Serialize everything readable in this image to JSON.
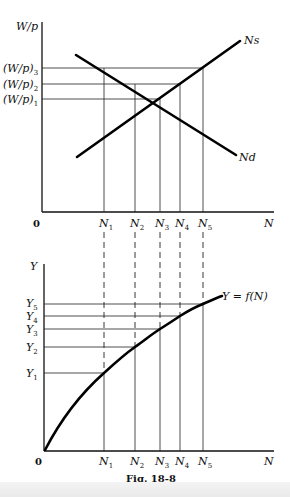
{
  "figure": {
    "caption": "Fig. 18-8",
    "zero_label": "0"
  },
  "top_panel": {
    "y_axis_label": "W/p",
    "x_axis_label": "N",
    "y_levels": [
      {
        "base": "(W/p)",
        "sub": "3"
      },
      {
        "base": "(W/p)",
        "sub": "2"
      },
      {
        "base": "(W/p)",
        "sub": "1"
      }
    ],
    "x_ticks": [
      {
        "base": "N",
        "sub": "1"
      },
      {
        "base": "N",
        "sub": "2"
      },
      {
        "base": "N",
        "sub": "3"
      },
      {
        "base": "N",
        "sub": "4"
      },
      {
        "base": "N",
        "sub": "5"
      }
    ],
    "curves": {
      "supply": "Ns",
      "demand": "Nd"
    }
  },
  "bottom_panel": {
    "y_axis_label": "Y",
    "x_axis_label": "N",
    "y_levels": [
      {
        "base": "Y",
        "sub": "5"
      },
      {
        "base": "Y",
        "sub": "4"
      },
      {
        "base": "Y",
        "sub": "3"
      },
      {
        "base": "Y",
        "sub": "2"
      },
      {
        "base": "Y",
        "sub": "1"
      }
    ],
    "x_ticks": [
      {
        "base": "N",
        "sub": "1"
      },
      {
        "base": "N",
        "sub": "2"
      },
      {
        "base": "N",
        "sub": "3"
      },
      {
        "base": "N",
        "sub": "4"
      },
      {
        "base": "N",
        "sub": "5"
      }
    ],
    "curve_label": "Y = f(N)"
  }
}
